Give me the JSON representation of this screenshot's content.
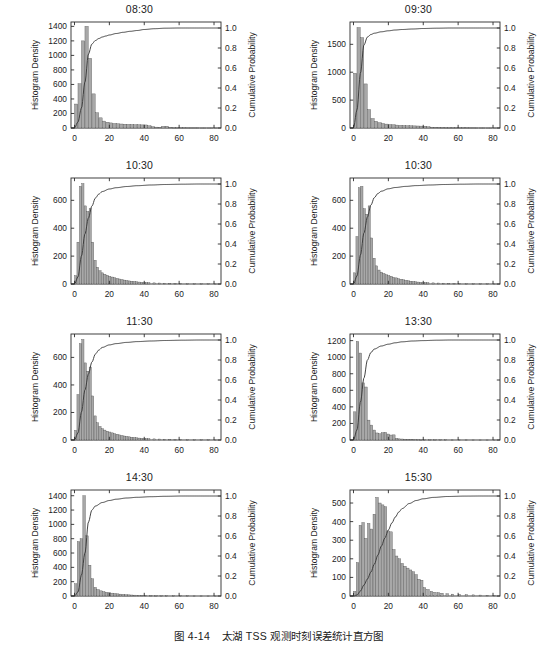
{
  "figure": {
    "caption_number": "图 4-14",
    "caption_text": "太湖 TSS 观测时刻误差统计直方图"
  },
  "axes_common": {
    "xlabel": "",
    "left_ylabel": "Histogram Density",
    "right_ylabel": "Cumulative Probability",
    "xticks": [
      0,
      20,
      40,
      60,
      80
    ],
    "xlim": [
      -2,
      84
    ],
    "right_yticks": [
      0.0,
      0.2,
      0.4,
      0.6,
      0.8,
      1.0
    ],
    "right_ytick_labels": [
      "0.0",
      "0.2",
      "0.4",
      "0.6",
      "0.8",
      "1.0"
    ],
    "right_ylim": [
      0,
      1.06
    ],
    "grid": false,
    "legend": "none",
    "bar_fill": "#a8a8a8",
    "bar_edge": "#4a4a4a",
    "line_color": "#3a3a3a",
    "frame_color": "#2b2b2b"
  },
  "chart_data": [
    {
      "type": "bar",
      "panel_index": 0,
      "title": "08:30",
      "xlabel": "",
      "ylabel": "Histogram Density",
      "y2label": "Cumulative Probability",
      "ylim": [
        0,
        1460
      ],
      "yticks": [
        0,
        200,
        400,
        600,
        800,
        1000,
        1200,
        1400
      ],
      "ytick_labels": [
        "0",
        "200",
        "400",
        "600",
        "800",
        "1000",
        "1200",
        "1400"
      ],
      "bin_width": 2,
      "bin_starts": [
        0,
        2,
        4,
        6,
        8,
        10,
        12,
        14,
        16,
        18,
        20,
        22,
        24,
        26,
        28,
        30,
        32,
        34,
        36,
        38,
        40,
        42,
        44,
        46,
        48,
        50,
        52,
        54,
        56,
        58,
        60,
        62,
        64,
        66,
        68,
        70,
        72,
        74,
        76,
        78,
        80
      ],
      "values": [
        330,
        610,
        1200,
        1400,
        960,
        470,
        210,
        140,
        95,
        80,
        70,
        62,
        58,
        55,
        52,
        50,
        48,
        46,
        45,
        43,
        42,
        30,
        18,
        12,
        10,
        22,
        24,
        8,
        5,
        4,
        3,
        3,
        2,
        2,
        2,
        2,
        1,
        1,
        1,
        1,
        1
      ],
      "cdf_x": [
        0,
        2,
        4,
        6,
        8,
        10,
        12,
        14,
        16,
        18,
        20,
        24,
        28,
        32,
        36,
        40,
        46,
        52,
        60,
        70,
        80,
        84
      ],
      "cdf_y": [
        0.0,
        0.06,
        0.2,
        0.46,
        0.74,
        0.84,
        0.875,
        0.895,
        0.91,
        0.92,
        0.93,
        0.945,
        0.957,
        0.967,
        0.975,
        0.985,
        0.993,
        0.998,
        1.0,
        1.0,
        1.0,
        1.0
      ]
    },
    {
      "type": "bar",
      "panel_index": 1,
      "title": "09:30",
      "xlabel": "",
      "ylabel": "Histogram Density",
      "y2label": "Cumulative Probability",
      "ylim": [
        0,
        1900
      ],
      "yticks": [
        0,
        500,
        1000,
        1500
      ],
      "ytick_labels": [
        "0",
        "500",
        "1000",
        "1500"
      ],
      "bin_width": 2,
      "bin_starts": [
        0,
        2,
        4,
        6,
        8,
        10,
        12,
        14,
        16,
        18,
        20,
        22,
        24,
        26,
        28,
        30,
        32,
        34,
        36,
        38,
        40,
        42,
        44,
        46,
        48,
        50,
        52,
        54,
        56,
        58,
        60,
        62,
        64,
        66,
        68,
        70,
        72,
        74,
        76,
        78,
        80
      ],
      "values": [
        980,
        1800,
        1620,
        790,
        330,
        170,
        120,
        95,
        80,
        70,
        62,
        58,
        52,
        48,
        45,
        42,
        40,
        38,
        36,
        34,
        32,
        22,
        15,
        12,
        10,
        9,
        8,
        7,
        6,
        5,
        5,
        4,
        4,
        3,
        3,
        2,
        2,
        2,
        1,
        1,
        1
      ],
      "cdf_x": [
        0,
        2,
        4,
        6,
        8,
        10,
        12,
        16,
        20,
        24,
        28,
        34,
        40,
        48,
        56,
        64,
        72,
        80,
        84
      ],
      "cdf_y": [
        0.0,
        0.18,
        0.55,
        0.83,
        0.91,
        0.935,
        0.948,
        0.962,
        0.972,
        0.98,
        0.985,
        0.99,
        0.995,
        0.998,
        1.0,
        1.0,
        1.0,
        1.0,
        1.0
      ]
    },
    {
      "type": "bar",
      "panel_index": 2,
      "title": "10:30",
      "xlabel": "",
      "ylabel": "Histogram Density",
      "y2label": "Cumulative Probability",
      "ylim": [
        0,
        760
      ],
      "yticks": [
        0,
        200,
        400,
        600
      ],
      "ytick_labels": [
        "0",
        "200",
        "400",
        "600"
      ],
      "bin_width": 1.4,
      "bin_starts": [
        0,
        1.4,
        2.8,
        4.2,
        5.6,
        7,
        8.4,
        9.8,
        11.2,
        12.6,
        14,
        15.4,
        16.8,
        18.2,
        19.6,
        21,
        22.4,
        23.8,
        25.2,
        26.6,
        28,
        29.4,
        30.8,
        32.2,
        33.6,
        35,
        36.4,
        37.8,
        39.2,
        40.6,
        42,
        45,
        48,
        51,
        54,
        57,
        60,
        64,
        68,
        72,
        76,
        80
      ],
      "values": [
        60,
        300,
        700,
        720,
        560,
        520,
        540,
        300,
        170,
        120,
        95,
        80,
        70,
        62,
        55,
        50,
        45,
        40,
        36,
        32,
        28,
        25,
        22,
        20,
        18,
        16,
        14,
        12,
        11,
        10,
        9,
        8,
        7,
        6,
        5,
        4,
        4,
        3,
        3,
        2,
        2,
        1
      ],
      "cdf_x": [
        0,
        2,
        4,
        6,
        8,
        10,
        12,
        14,
        16,
        20,
        24,
        30,
        36,
        44,
        52,
        62,
        72,
        80,
        84
      ],
      "cdf_y": [
        0.0,
        0.07,
        0.28,
        0.5,
        0.66,
        0.78,
        0.86,
        0.9,
        0.925,
        0.95,
        0.963,
        0.975,
        0.983,
        0.99,
        0.995,
        0.998,
        1.0,
        1.0,
        1.0
      ]
    },
    {
      "type": "bar",
      "panel_index": 3,
      "title": "10:30",
      "xlabel": "",
      "ylabel": "Histogram Density",
      "y2label": "Cumulative Probability",
      "ylim": [
        0,
        760
      ],
      "yticks": [
        0,
        200,
        400,
        600
      ],
      "ytick_labels": [
        "0",
        "200",
        "400",
        "600"
      ],
      "bin_width": 1.4,
      "bin_starts": [
        0,
        1.4,
        2.8,
        4.2,
        5.6,
        7,
        8.4,
        9.8,
        11.2,
        12.6,
        14,
        15.4,
        16.8,
        18.2,
        19.6,
        21,
        22.4,
        23.8,
        25.2,
        26.6,
        28,
        29.4,
        30.8,
        32.2,
        33.6,
        35,
        36.4,
        37.8,
        39.2,
        40.6,
        42,
        45,
        48,
        51,
        54,
        57,
        60,
        64,
        68,
        72,
        76,
        80
      ],
      "values": [
        80,
        340,
        690,
        700,
        540,
        500,
        560,
        330,
        185,
        130,
        100,
        85,
        75,
        66,
        60,
        55,
        48,
        44,
        38,
        34,
        30,
        26,
        23,
        20,
        18,
        16,
        14,
        12,
        11,
        10,
        9,
        8,
        7,
        6,
        5,
        4,
        4,
        3,
        3,
        2,
        2,
        1
      ],
      "cdf_x": [
        0,
        2,
        4,
        6,
        8,
        10,
        12,
        14,
        16,
        20,
        24,
        30,
        36,
        44,
        52,
        62,
        72,
        80,
        84
      ],
      "cdf_y": [
        0.0,
        0.08,
        0.29,
        0.51,
        0.67,
        0.79,
        0.865,
        0.905,
        0.928,
        0.952,
        0.965,
        0.976,
        0.984,
        0.99,
        0.995,
        0.998,
        1.0,
        1.0,
        1.0
      ]
    },
    {
      "type": "bar",
      "panel_index": 4,
      "title": "11:30",
      "xlabel": "",
      "ylabel": "Histogram Density",
      "y2label": "Cumulative Probability",
      "ylim": [
        0,
        770
      ],
      "yticks": [
        0,
        200,
        400,
        600
      ],
      "ytick_labels": [
        "0",
        "200",
        "400",
        "600"
      ],
      "bin_width": 1.4,
      "bin_starts": [
        0,
        1.4,
        2.8,
        4.2,
        5.6,
        7,
        8.4,
        9.8,
        11.2,
        12.6,
        14,
        15.4,
        16.8,
        18.2,
        19.6,
        21,
        22.4,
        23.8,
        25.2,
        26.6,
        28,
        29.4,
        30.8,
        32.2,
        33.6,
        35,
        36.4,
        37.8,
        39.2,
        40.6,
        42,
        45,
        48,
        51,
        54,
        57,
        60,
        64,
        68,
        72,
        76,
        80
      ],
      "values": [
        70,
        330,
        700,
        730,
        560,
        500,
        530,
        320,
        175,
        125,
        98,
        82,
        72,
        64,
        58,
        52,
        46,
        42,
        37,
        33,
        29,
        26,
        23,
        20,
        18,
        16,
        14,
        12,
        11,
        10,
        9,
        8,
        7,
        6,
        5,
        4,
        4,
        3,
        3,
        2,
        2,
        1
      ],
      "cdf_x": [
        0,
        2,
        4,
        6,
        8,
        10,
        12,
        14,
        16,
        20,
        24,
        30,
        36,
        44,
        52,
        62,
        72,
        80,
        84
      ],
      "cdf_y": [
        0.0,
        0.07,
        0.28,
        0.5,
        0.66,
        0.78,
        0.86,
        0.9,
        0.926,
        0.951,
        0.964,
        0.976,
        0.984,
        0.99,
        0.995,
        0.998,
        1.0,
        1.0,
        1.0
      ]
    },
    {
      "type": "bar",
      "panel_index": 5,
      "title": "13:30",
      "xlabel": "",
      "ylabel": "Histogram Density",
      "y2label": "Cumulative Probability",
      "ylim": [
        0,
        1280
      ],
      "yticks": [
        0,
        200,
        400,
        600,
        800,
        1000,
        1200
      ],
      "ytick_labels": [
        "0",
        "200",
        "400",
        "600",
        "800",
        "1000",
        "1200"
      ],
      "bin_width": 1.6,
      "bin_starts": [
        0,
        1.6,
        3.2,
        4.8,
        6.4,
        8,
        9.6,
        11.2,
        12.8,
        14.4,
        16,
        17.6,
        19.2,
        20.8,
        22.4,
        24,
        25.6,
        27.2,
        28.8,
        30.4,
        32,
        34,
        36,
        38,
        40,
        43,
        46,
        49,
        52,
        56,
        60,
        64,
        68,
        72,
        76,
        80
      ],
      "values": [
        340,
        1190,
        1050,
        690,
        640,
        240,
        180,
        120,
        85,
        75,
        88,
        92,
        72,
        60,
        62,
        20,
        14,
        12,
        10,
        9,
        8,
        7,
        6,
        5,
        5,
        4,
        4,
        3,
        3,
        2,
        2,
        2,
        1,
        1,
        1,
        1
      ],
      "cdf_x": [
        0,
        2,
        4,
        6,
        8,
        10,
        12,
        16,
        20,
        24,
        28,
        34,
        40,
        48,
        56,
        66,
        76,
        84
      ],
      "cdf_y": [
        0.0,
        0.1,
        0.38,
        0.62,
        0.8,
        0.875,
        0.91,
        0.94,
        0.958,
        0.972,
        0.982,
        0.99,
        0.994,
        0.998,
        1.0,
        1.0,
        1.0,
        1.0
      ]
    },
    {
      "type": "bar",
      "panel_index": 6,
      "title": "14:30",
      "xlabel": "",
      "ylabel": "Histogram Density",
      "y2label": "Cumulative Probability",
      "ylim": [
        0,
        1480
      ],
      "yticks": [
        0,
        200,
        400,
        600,
        800,
        1000,
        1200,
        1400
      ],
      "ytick_labels": [
        "0",
        "200",
        "400",
        "600",
        "800",
        "1000",
        "1200",
        "1400"
      ],
      "bin_width": 1.6,
      "bin_starts": [
        0,
        1.6,
        3.2,
        4.8,
        6.4,
        8,
        9.6,
        11.2,
        12.8,
        14.4,
        16,
        17.6,
        19.2,
        20.8,
        22.4,
        24,
        25.6,
        27.2,
        28.8,
        30.4,
        32,
        34,
        36,
        38,
        40,
        43,
        46,
        49,
        52,
        56,
        60,
        64,
        68,
        72,
        76,
        80
      ],
      "values": [
        170,
        760,
        800,
        1400,
        840,
        430,
        240,
        120,
        90,
        72,
        60,
        52,
        45,
        40,
        35,
        30,
        26,
        22,
        19,
        16,
        14,
        12,
        10,
        9,
        8,
        7,
        6,
        5,
        4,
        4,
        3,
        3,
        2,
        2,
        1,
        1
      ],
      "cdf_x": [
        0,
        2,
        4,
        6,
        8,
        10,
        12,
        16,
        20,
        24,
        30,
        36,
        44,
        52,
        62,
        72,
        84
      ],
      "cdf_y": [
        0.0,
        0.04,
        0.21,
        0.43,
        0.74,
        0.86,
        0.9,
        0.935,
        0.955,
        0.968,
        0.98,
        0.987,
        0.993,
        0.997,
        1.0,
        1.0,
        1.0
      ]
    },
    {
      "type": "bar",
      "panel_index": 7,
      "title": "15:30",
      "xlabel": "",
      "ylabel": "Histogram Density",
      "y2label": "Cumulative Probability",
      "ylim": [
        0,
        570
      ],
      "yticks": [
        0,
        100,
        200,
        300,
        400,
        500
      ],
      "ytick_labels": [
        "0",
        "100",
        "200",
        "300",
        "400",
        "500"
      ],
      "bin_width": 1.6,
      "bin_starts": [
        0,
        1.6,
        3.2,
        4.8,
        6.4,
        8,
        9.6,
        11.2,
        12.8,
        14.4,
        16,
        17.6,
        19.2,
        20.8,
        22.4,
        24,
        25.6,
        27.2,
        28.8,
        30.4,
        32,
        33.6,
        35.2,
        36.8,
        38.4,
        40,
        42,
        44,
        46,
        48,
        50,
        53,
        56,
        60,
        64,
        68,
        72,
        76,
        80
      ],
      "values": [
        25,
        180,
        380,
        395,
        310,
        390,
        360,
        440,
        530,
        500,
        490,
        480,
        350,
        345,
        250,
        215,
        200,
        175,
        160,
        150,
        140,
        130,
        115,
        90,
        85,
        45,
        35,
        25,
        20,
        18,
        15,
        12,
        10,
        8,
        7,
        6,
        5,
        4,
        3
      ],
      "cdf_x": [
        0,
        2,
        4,
        6,
        8,
        10,
        12,
        14,
        16,
        18,
        20,
        22,
        24,
        26,
        28,
        32,
        36,
        40,
        46,
        54,
        64,
        74,
        84
      ],
      "cdf_y": [
        0.0,
        0.01,
        0.05,
        0.11,
        0.17,
        0.24,
        0.32,
        0.41,
        0.5,
        0.58,
        0.66,
        0.73,
        0.79,
        0.84,
        0.875,
        0.925,
        0.955,
        0.972,
        0.986,
        0.995,
        0.999,
        1.0,
        1.0
      ]
    }
  ]
}
